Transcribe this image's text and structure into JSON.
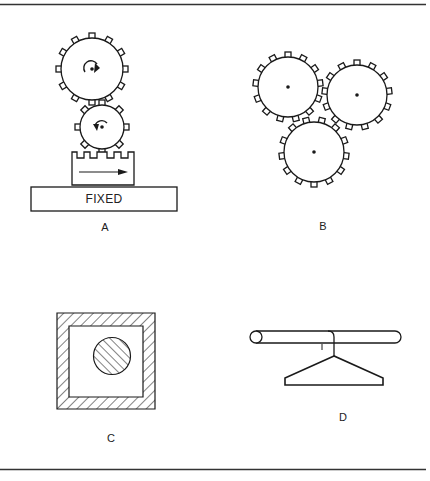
{
  "figure": {
    "frame": {
      "top_rule_y": 4,
      "bottom_rule_y": 469,
      "line_color": "#333333"
    },
    "panels": [
      {
        "id": "A",
        "label": "A",
        "description": "Two meshing spur gears driving a rack that slides on a fixed base",
        "fixed_base_text": "FIXED",
        "elements": [
          "large-gear-clockwise-arrow",
          "small-gear-counterclockwise-arrow",
          "toothed-rack-with-right-arrow",
          "fixed-base"
        ]
      },
      {
        "id": "B",
        "label": "B",
        "description": "Three mutually meshing spur gears in a triangular arrangement",
        "elements": [
          "gear-top-left",
          "gear-top-right",
          "gear-bottom"
        ]
      },
      {
        "id": "C",
        "label": "C",
        "description": "Hatched square frame cross-section enclosing a hatched circular shaft",
        "elements": [
          "hatched-square-frame",
          "hatched-circle"
        ]
      },
      {
        "id": "D",
        "label": "D",
        "description": "Coat hanger hanging on a horizontal cylindrical rod",
        "elements": [
          "cylindrical-rod",
          "hanger-hook",
          "hanger-body"
        ]
      }
    ],
    "colors": {
      "stroke": "#1a1a1a",
      "background": "#ffffff"
    }
  }
}
